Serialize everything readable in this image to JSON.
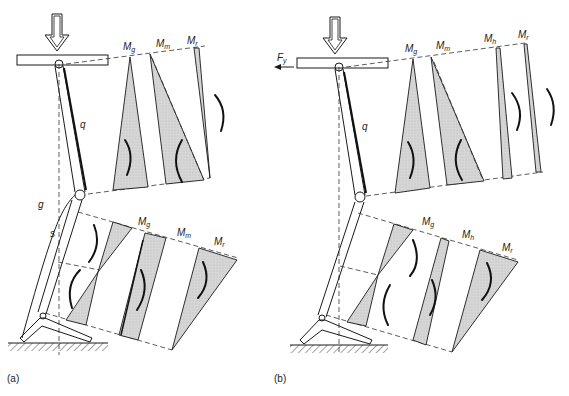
{
  "figure": {
    "panel_a": {
      "caption": "(a)",
      "top_moments": [
        "M",
        "M",
        "M"
      ],
      "top_moment_subscripts": [
        "g",
        "m",
        "r"
      ],
      "bottom_moments": [
        "M",
        "M",
        "M"
      ],
      "bottom_moment_subscripts": [
        "g",
        "m",
        "r"
      ],
      "member_labels": {
        "upper": "q",
        "outer": "g",
        "lower": "s"
      }
    },
    "panel_b": {
      "caption": "(b)",
      "force_label": "F",
      "force_subscript": "y",
      "top_moments": [
        "M",
        "M",
        "M",
        "M"
      ],
      "top_moment_subscripts": [
        "g",
        "m",
        "h",
        "r"
      ],
      "bottom_moments": [
        "M",
        "M",
        "M"
      ],
      "bottom_moment_subscripts": [
        "g",
        "h",
        "r"
      ],
      "member_labels": {
        "upper": "q"
      }
    },
    "colors": {
      "ink": "#1a1a1a",
      "shade": "#d4d4d4",
      "background": "#ffffff"
    }
  }
}
